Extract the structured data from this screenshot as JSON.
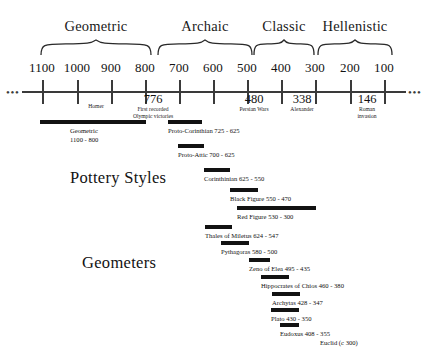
{
  "figure": {
    "axis": {
      "scale_note": "years BC, decreasing left to right",
      "left_ellipsis": "•••",
      "right_ellipsis": "•••",
      "ticks": [
        {
          "label": "1100",
          "year": 1100,
          "x": 42
        },
        {
          "label": "1000",
          "year": 1000,
          "x": 77
        },
        {
          "label": "900",
          "year": 900,
          "x": 111
        },
        {
          "label": "800",
          "year": 800,
          "x": 145
        },
        {
          "label": "700",
          "year": 700,
          "x": 179
        },
        {
          "label": "600",
          "year": 600,
          "x": 213
        },
        {
          "label": "500",
          "year": 500,
          "x": 247
        },
        {
          "label": "400",
          "year": 400,
          "x": 281
        },
        {
          "label": "300",
          "year": 300,
          "x": 315
        },
        {
          "label": "200",
          "year": 200,
          "x": 350
        },
        {
          "label": "100",
          "year": 100,
          "x": 384
        }
      ],
      "events": [
        {
          "number": "",
          "caption": "Homer",
          "year": 850,
          "x": 96,
          "num_x": 96
        },
        {
          "number": "776",
          "caption": "First recorded\nOlympic victories",
          "year": 776,
          "x": 153,
          "num_x": 153
        },
        {
          "number": "480",
          "caption": "Persian Wars",
          "year": 480,
          "x": 254,
          "num_x": 254
        },
        {
          "number": "338",
          "caption": "Alexander",
          "year": 338,
          "x": 302,
          "num_x": 302
        },
        {
          "number": "146",
          "caption": "Roman\ninvasion",
          "year": 146,
          "x": 367,
          "num_x": 367
        }
      ]
    },
    "periods": [
      {
        "name": "Geometric",
        "from": 1100,
        "to": 800,
        "x": 40,
        "width": 112,
        "center": 96
      },
      {
        "name": "Archaic",
        "from": 760,
        "to": 500,
        "x": 157,
        "width": 96,
        "center": 205
      },
      {
        "name": "Classic",
        "from": 500,
        "to": 330,
        "x": 253,
        "width": 62,
        "center": 284
      },
      {
        "name": "Hellenistic",
        "from": 330,
        "to": 130,
        "x": 317,
        "width": 76,
        "center": 355
      }
    ],
    "sections": [
      {
        "title": "Pottery Styles",
        "x": 70,
        "y": 168
      },
      {
        "title": "Geometers",
        "x": 82,
        "y": 253
      }
    ],
    "pottery_styles": [
      {
        "label": "Geometric\n1100 - 800",
        "from": 1100,
        "to": 800,
        "bar_x": 40,
        "bar_w": 106,
        "bar_y": 120,
        "label_x": 70,
        "label_y": 127
      },
      {
        "label": "Proto-Corinthian 725 - 625",
        "from": 725,
        "to": 625,
        "bar_x": 168,
        "bar_w": 34,
        "bar_y": 120,
        "label_x": 168,
        "label_y": 127
      },
      {
        "label": "Proto-Attic 700 - 625",
        "from": 700,
        "to": 625,
        "bar_x": 178,
        "bar_w": 26,
        "bar_y": 144,
        "label_x": 178,
        "label_y": 151
      },
      {
        "label": "Corinthinian 625 - 550",
        "from": 625,
        "to": 550,
        "bar_x": 204,
        "bar_w": 26,
        "bar_y": 168,
        "label_x": 204,
        "label_y": 175
      },
      {
        "label": "Black Figure 550 - 470",
        "from": 550,
        "to": 470,
        "bar_x": 230,
        "bar_w": 28,
        "bar_y": 188,
        "label_x": 230,
        "label_y": 195
      },
      {
        "label": "Red Figure 530 - 300",
        "from": 530,
        "to": 300,
        "bar_x": 237,
        "bar_w": 79,
        "bar_y": 206,
        "label_x": 237,
        "label_y": 213
      }
    ],
    "geometers": [
      {
        "label": "Thales of Miletus 624 - 547",
        "from": 624,
        "to": 547,
        "bar_x": 205,
        "bar_w": 27,
        "bar_y": 225,
        "label_x": 205,
        "label_y": 232
      },
      {
        "label": "Pythagoras 580 - 500",
        "from": 580,
        "to": 500,
        "bar_x": 221,
        "bar_w": 28,
        "bar_y": 241,
        "label_x": 221,
        "label_y": 248
      },
      {
        "label": "Zeno of Elea 495 - 435",
        "from": 495,
        "to": 435,
        "bar_x": 249,
        "bar_w": 21,
        "bar_y": 258,
        "label_x": 249,
        "label_y": 265
      },
      {
        "label": "Hippocrates of Chios 460 - 380",
        "from": 460,
        "to": 380,
        "bar_x": 261,
        "bar_w": 28,
        "bar_y": 275,
        "label_x": 261,
        "label_y": 282
      },
      {
        "label": "Archytas 428 - 347",
        "from": 428,
        "to": 347,
        "bar_x": 272,
        "bar_w": 28,
        "bar_y": 292,
        "label_x": 272,
        "label_y": 299
      },
      {
        "label": "Plato 430 - 350",
        "from": 430,
        "to": 350,
        "bar_x": 271,
        "bar_w": 28,
        "bar_y": 308,
        "label_x": 271,
        "label_y": 315
      },
      {
        "label": "Eudoxus 408 - 355",
        "from": 408,
        "to": 355,
        "bar_x": 280,
        "bar_w": 19,
        "bar_y": 323,
        "label_x": 280,
        "label_y": 330
      },
      {
        "label": "Euclid (c 300)",
        "from": 300,
        "to": 300,
        "bar_x": 0,
        "bar_w": 0,
        "bar_y": 0,
        "label_x": 320,
        "label_y": 339
      }
    ],
    "colors": {
      "ink": "#121212",
      "bar": "#121212",
      "axis": "#3a3a3a",
      "background": "#ffffff"
    }
  }
}
